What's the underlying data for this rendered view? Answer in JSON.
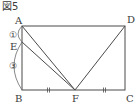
{
  "figure": {
    "title": "図5",
    "points": {
      "A": {
        "label": "A",
        "x": 22,
        "y": 26
      },
      "B": {
        "label": "B",
        "x": 22,
        "y": 90
      },
      "C": {
        "label": "C",
        "x": 125,
        "y": 90
      },
      "D": {
        "label": "D",
        "x": 125,
        "y": 26
      },
      "E": {
        "label": "E",
        "x": 22,
        "y": 42
      },
      "F": {
        "label": "F",
        "x": 75,
        "y": 90
      }
    },
    "segments": [
      "AD",
      "DC",
      "CB",
      "BA",
      "AF",
      "EF",
      "DF"
    ],
    "ratio_labels": {
      "AE": "①",
      "EB": "③"
    },
    "equal_marks": {
      "BF": "||",
      "FC": "||"
    },
    "colors": {
      "line": "#4a4a4a",
      "text": "#3a3a3a",
      "background": "#ffffff"
    }
  }
}
